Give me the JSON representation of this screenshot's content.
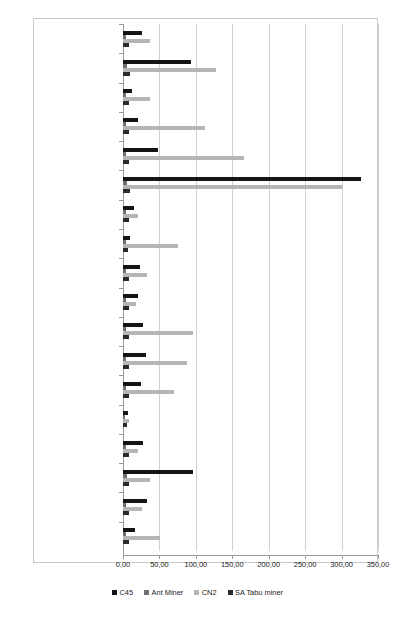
{
  "chart_data": {
    "type": "bar",
    "orientation": "horizontal",
    "title": "",
    "subtitle": "",
    "xlabel": "",
    "ylabel": "",
    "xlim": [
      0,
      350
    ],
    "xticks": [
      0,
      50,
      100,
      150,
      200,
      250,
      300,
      350
    ],
    "xticklabels": [
      "0,00",
      "50,00",
      "100,00",
      "150,00",
      "200,00",
      "250,00",
      "300,00",
      "350,00"
    ],
    "grid": "vertical",
    "legend_position": "bottom",
    "categories": [
      "Parkinson",
      "Heart",
      "Transfusion",
      "Mamography",
      "Pima",
      "Nursery",
      "PostOp",
      "Haberman",
      "Echocardiogram",
      "New Tyroid",
      "BUPA",
      "ANN",
      "AllBP",
      "Hepatitis",
      "Dermatology",
      "tic-tac-toe",
      "Wisconsin breast cancer",
      "Ljubljana breast cancer"
    ],
    "series": [
      {
        "name": "C45",
        "color": "#141414",
        "values": [
          26,
          94,
          12,
          20,
          48,
          326,
          15,
          9,
          23,
          20,
          27,
          31,
          25,
          7,
          28,
          96,
          33,
          16
        ]
      },
      {
        "name": "Ant Miner",
        "color": "#6f6f6f",
        "values": [
          4,
          5,
          4,
          4,
          4,
          5,
          4,
          4,
          4,
          4,
          4,
          4,
          4,
          3,
          4,
          5,
          4,
          4
        ]
      },
      {
        "name": "CN2",
        "color": "#b5b5b5",
        "values": [
          37,
          128,
          37,
          112,
          166,
          300,
          21,
          76,
          33,
          18,
          96,
          88,
          70,
          8,
          20,
          37,
          26,
          51
        ]
      },
      {
        "name": "SA Tabu miner",
        "color": "#2b2b2b",
        "values": [
          8,
          9,
          8,
          8,
          8,
          9,
          8,
          7,
          8,
          8,
          8,
          8,
          8,
          5,
          8,
          8,
          8,
          8
        ]
      }
    ]
  },
  "legend": {
    "items": [
      {
        "label": "C45",
        "color": "#141414"
      },
      {
        "label": "Ant Miner",
        "color": "#6f6f6f"
      },
      {
        "label": "CN2",
        "color": "#b5b5b5"
      },
      {
        "label": "SA Tabu miner",
        "color": "#2b2b2b"
      }
    ]
  }
}
